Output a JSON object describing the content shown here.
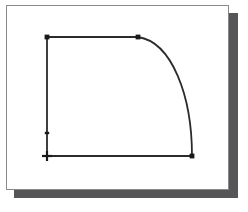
{
  "panel": {
    "background_color": "#ffffff",
    "border_color": "#8a8a8d",
    "shadow_color": "#565659",
    "x": 6,
    "y": 5,
    "width": 223,
    "height": 185
  },
  "figure": {
    "title": "",
    "caption": "",
    "stroke_color": "#2b2b2b",
    "stroke_width": 1.8,
    "marker_color": "#1a1a1a"
  },
  "chart_data": {
    "type": "line",
    "title": "",
    "xlabel": "",
    "ylabel": "",
    "grid": false,
    "legend": false,
    "xlim": [
      47,
      192
    ],
    "ylim": [
      37,
      156
    ],
    "nodes": [
      {
        "name": "top-left-corner",
        "x": 47,
        "y": 37,
        "marker": "square"
      },
      {
        "name": "top-right-corner",
        "x": 138,
        "y": 37,
        "marker": "square"
      },
      {
        "name": "left-mid-tick",
        "x": 47,
        "y": 133,
        "marker": "tick"
      },
      {
        "name": "origin-corner",
        "x": 47,
        "y": 156,
        "marker": "cross"
      },
      {
        "name": "bottom-right-corner",
        "x": 192,
        "y": 156,
        "marker": "square"
      }
    ],
    "segments": [
      {
        "name": "top-edge",
        "kind": "line",
        "from": [
          47,
          37
        ],
        "to": [
          138,
          37
        ]
      },
      {
        "name": "left-edge",
        "kind": "line",
        "from": [
          47,
          37
        ],
        "to": [
          47,
          156
        ]
      },
      {
        "name": "bottom-edge",
        "kind": "line",
        "from": [
          47,
          156
        ],
        "to": [
          192,
          156
        ]
      },
      {
        "name": "arc-edge",
        "kind": "arc",
        "from": [
          138,
          37
        ],
        "to": [
          192,
          156
        ],
        "control_points": [
          [
            172,
            42
          ],
          [
            192,
            96
          ]
        ]
      }
    ]
  }
}
